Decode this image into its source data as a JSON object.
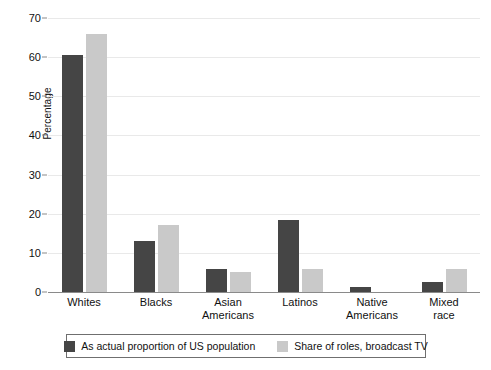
{
  "chart_data": {
    "type": "bar",
    "title": "",
    "xlabel": "",
    "ylabel": "Percentage",
    "ylim": [
      0,
      70
    ],
    "ytick_step": 10,
    "yticks": [
      0,
      10,
      20,
      30,
      40,
      50,
      60,
      70
    ],
    "ytick_labels": [
      "0",
      "10",
      "20",
      "30",
      "40",
      "50",
      "60",
      "70"
    ],
    "grid": true,
    "legend_position": "bottom",
    "categories": [
      "Whites",
      "Asian Americans",
      "Blacks",
      "Latinos",
      "Native Americans",
      "Mixed race"
    ],
    "category_lines": [
      [
        "Whites"
      ],
      [
        "Blacks"
      ],
      [
        "Asian",
        "Americans"
      ],
      [
        "Latinos"
      ],
      [
        "Native",
        "Americans"
      ],
      [
        "Mixed",
        "race"
      ]
    ],
    "category_order": [
      "Whites",
      "Blacks",
      "Asian Americans",
      "Latinos",
      "Native Americans",
      "Mixed race"
    ],
    "series": [
      {
        "name": "As actual proportion of US population",
        "color": "#454545",
        "values": [
          60.5,
          13,
          6,
          18.5,
          1.3,
          2.5
        ]
      },
      {
        "name": "Share of roles, broadcast TV",
        "color": "#c9c9c9",
        "values": [
          66,
          17,
          5,
          6,
          0,
          6
        ]
      }
    ]
  },
  "axis": {
    "y_title": "Percentage"
  },
  "legend": {
    "entries": [
      {
        "label": "As actual proportion of US population",
        "color": "#454545"
      },
      {
        "label": "Share of roles, broadcast TV",
        "color": "#c9c9c9"
      }
    ]
  }
}
